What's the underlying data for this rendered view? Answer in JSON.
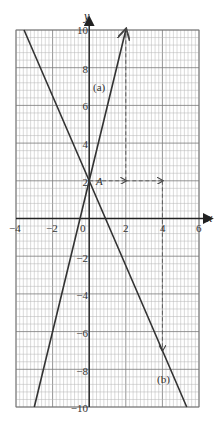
{
  "chart_data": {
    "type": "line",
    "title": "",
    "xlabel": "x",
    "ylabel": "y",
    "xlim": [
      -4,
      6
    ],
    "ylim": [
      -10,
      10
    ],
    "grid": true,
    "x_ticks": [
      -4,
      -2,
      0,
      2,
      4,
      6
    ],
    "y_ticks": [
      10,
      8,
      6,
      4,
      2,
      -2,
      -4,
      -6,
      -8,
      -10
    ],
    "series": [
      {
        "name": "(a)",
        "equation": "y = 4x + 2",
        "x": [
          -3,
          0,
          2
        ],
        "y": [
          -10,
          2,
          10
        ],
        "arrow_end": true
      },
      {
        "name": "(b)",
        "equation": "y = -2.25x + 2",
        "x": [
          -3.56,
          0,
          4,
          5.33
        ],
        "y": [
          10,
          2,
          -7,
          -10
        ]
      }
    ],
    "annotations": [
      {
        "text": "A",
        "point": [
          0,
          2
        ]
      },
      {
        "text": "(a)",
        "position": [
          0.5,
          7
        ]
      },
      {
        "text": "(b)",
        "position": [
          4.5,
          -8.5
        ]
      }
    ],
    "dashed_guides": [
      {
        "from": [
          0,
          2
        ],
        "to": [
          2,
          2
        ],
        "arrow": true
      },
      {
        "from": [
          2,
          2
        ],
        "to": [
          4,
          2
        ],
        "arrow": true
      },
      {
        "from": [
          2,
          2
        ],
        "to": [
          2,
          10
        ]
      },
      {
        "from": [
          4,
          2
        ],
        "to": [
          4,
          -7
        ],
        "arrow": true
      }
    ]
  },
  "labels": {
    "x_axis": "x",
    "y_axis": "y",
    "point_A": "A",
    "line_a": "(a)",
    "line_b": "(b)",
    "origin": "0",
    "xt": [
      "−4",
      "−2",
      "2",
      "4",
      "6"
    ],
    "yt": [
      "10",
      "8",
      "6",
      "4",
      "2",
      "−2",
      "−4",
      "−6",
      "−8",
      "−10"
    ]
  }
}
